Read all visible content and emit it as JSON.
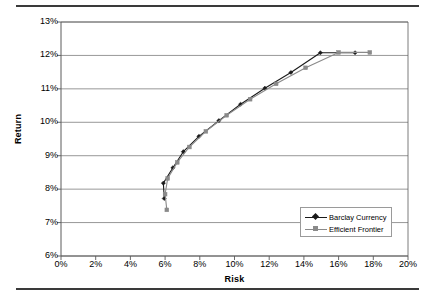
{
  "chart_data": {
    "type": "line",
    "title": "",
    "xlabel": "Risk",
    "ylabel": "Return",
    "xlim": [
      0,
      20
    ],
    "ylim": [
      6,
      13
    ],
    "xticks": [
      "0%",
      "2%",
      "4%",
      "6%",
      "8%",
      "10%",
      "12%",
      "14%",
      "16%",
      "18%",
      "20%"
    ],
    "yticks": [
      "6%",
      "7%",
      "8%",
      "9%",
      "10%",
      "11%",
      "12%",
      "13%"
    ],
    "xtick_values": [
      0,
      2,
      4,
      6,
      8,
      10,
      12,
      14,
      16,
      18,
      20
    ],
    "ytick_values": [
      6,
      7,
      8,
      9,
      10,
      11,
      12,
      13
    ],
    "grid": "horizontal",
    "legend_position": "inside-bottom-right",
    "series": [
      {
        "name": "Barclay Currency",
        "color": "#1a1a1a",
        "marker": "diamond",
        "points": [
          [
            5.95,
            7.72
          ],
          [
            5.9,
            8.18
          ],
          [
            6.45,
            8.64
          ],
          [
            7.05,
            9.12
          ],
          [
            7.95,
            9.58
          ],
          [
            9.1,
            10.05
          ],
          [
            10.35,
            10.54
          ],
          [
            11.75,
            11.02
          ],
          [
            13.25,
            11.49
          ],
          [
            14.95,
            12.08
          ],
          [
            16.95,
            12.08
          ]
        ]
      },
      {
        "name": "Efficient Frontier",
        "color": "#8a8a8a",
        "marker": "square",
        "points": [
          [
            6.1,
            7.38
          ],
          [
            6.0,
            7.85
          ],
          [
            6.15,
            8.32
          ],
          [
            6.7,
            8.8
          ],
          [
            7.4,
            9.26
          ],
          [
            8.35,
            9.73
          ],
          [
            9.55,
            10.21
          ],
          [
            10.9,
            10.69
          ],
          [
            12.4,
            11.15
          ],
          [
            14.1,
            11.63
          ],
          [
            16.0,
            12.09
          ],
          [
            17.8,
            12.09
          ]
        ]
      }
    ]
  },
  "legend": {
    "items": [
      {
        "label": "Barclay Currency"
      },
      {
        "label": "Efficient Frontier"
      }
    ]
  },
  "colors": {
    "series_primary": "#1a1a1a",
    "series_secondary": "#8a8a8a",
    "gridline": "#7d7d7d",
    "frame": "#5a5a5a",
    "rule": "#3a3a3a"
  }
}
